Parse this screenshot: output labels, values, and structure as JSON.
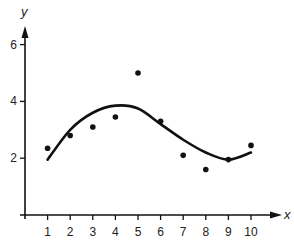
{
  "chart_data": {
    "type": "scatter",
    "title": "",
    "xlabel": "x",
    "ylabel": "y",
    "xlim": [
      0,
      10.5
    ],
    "ylim": [
      0,
      6.5
    ],
    "x_ticks": [
      "1",
      "2",
      "3",
      "4",
      "5",
      "6",
      "7",
      "8",
      "9",
      "10"
    ],
    "y_ticks": [
      "2",
      "4",
      "6"
    ],
    "grid": false,
    "legend": null,
    "series": [
      {
        "name": "data points",
        "type": "scatter",
        "x": [
          1,
          2,
          3,
          4,
          5,
          6,
          7,
          8,
          9,
          10
        ],
        "y": [
          2.35,
          2.8,
          3.1,
          3.45,
          5.0,
          3.3,
          2.1,
          1.6,
          1.95,
          2.45
        ]
      },
      {
        "name": "fitted curve",
        "type": "line",
        "x": [
          1,
          2,
          3,
          4,
          5,
          6,
          7,
          8,
          9,
          10
        ],
        "y": [
          1.95,
          3.0,
          3.6,
          3.85,
          3.75,
          3.2,
          2.65,
          2.2,
          1.95,
          2.2
        ]
      }
    ]
  }
}
